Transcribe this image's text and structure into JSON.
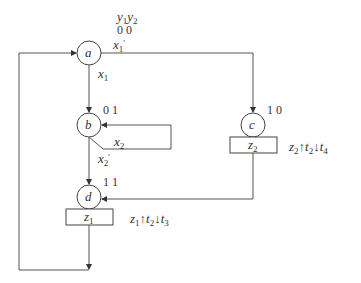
{
  "diagram": {
    "type": "asm-flowchart",
    "state_var_header": {
      "y1": "y",
      "y1_sub": "1",
      "y2": "y",
      "y2_sub": "2"
    },
    "states": [
      {
        "id": "a",
        "label": "a",
        "code": "0 0"
      },
      {
        "id": "b",
        "label": "b",
        "code": "0 1"
      },
      {
        "id": "c",
        "label": "c",
        "code": "1 0"
      },
      {
        "id": "d",
        "label": "d",
        "code": "1 1"
      }
    ],
    "outputs": [
      {
        "state": "c",
        "var": "z",
        "sub": "2",
        "annotation": {
          "v": "z",
          "vs": "2",
          "up": "↑",
          "t1": "t",
          "t1s": "2",
          "down": "↓",
          "t2": "t",
          "t2s": "4"
        }
      },
      {
        "state": "d",
        "var": "z",
        "sub": "1",
        "annotation": {
          "v": "z",
          "vs": "1",
          "up": "↑",
          "t1": "t",
          "t1s": "2",
          "down": "↓",
          "t2": "t",
          "t2s": "3"
        }
      }
    ],
    "transitions": [
      {
        "from": "a",
        "to": "b",
        "cond": "x",
        "sub": "1",
        "prime": ""
      },
      {
        "from": "a",
        "to": "c",
        "cond": "x",
        "sub": "1",
        "prime": "'"
      },
      {
        "from": "b",
        "to": "b",
        "cond": "x",
        "sub": "2",
        "prime": ""
      },
      {
        "from": "b",
        "to": "d",
        "cond": "x",
        "sub": "2",
        "prime": "'"
      },
      {
        "from": "c",
        "to": "d",
        "cond": "",
        "sub": "",
        "prime": ""
      },
      {
        "from": "d",
        "to": "a",
        "cond": "",
        "sub": "",
        "prime": ""
      }
    ]
  }
}
